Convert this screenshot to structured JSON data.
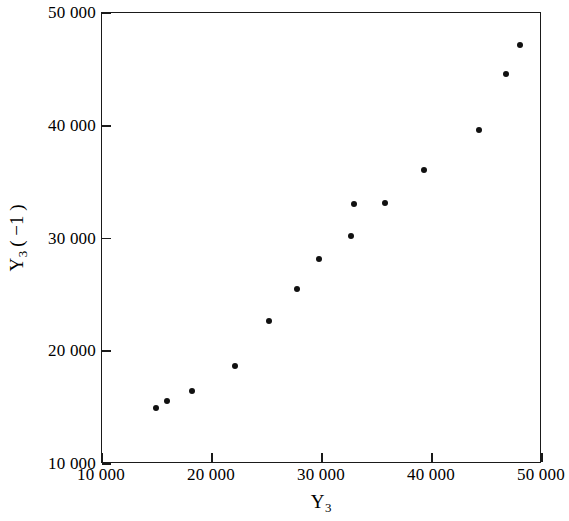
{
  "chart_data": {
    "type": "scatter",
    "title": "",
    "xlabel": "Y3",
    "ylabel": "Y3 (-1)",
    "xlabel_base": "Y",
    "xlabel_sub": "3",
    "ylabel_base": "Y",
    "ylabel_sub": "3",
    "ylabel_paren": "( −1 )",
    "xlim": [
      10000,
      50000
    ],
    "ylim": [
      10000,
      50000
    ],
    "xticks": [
      10000,
      20000,
      30000,
      40000,
      50000
    ],
    "yticks": [
      10000,
      20000,
      30000,
      40000,
      50000
    ],
    "xticklabels": [
      "10 000",
      "20 000",
      "30 000",
      "40 000",
      "50 000"
    ],
    "yticklabels": [
      "10 000",
      "20 000",
      "30 000",
      "40 000",
      "50 000"
    ],
    "grid": false,
    "legend": null,
    "marker": "filled-circle",
    "marker_color": "#111111",
    "frame_color": "#1a1a1a",
    "background": "#ffffff",
    "x": [
      14900,
      15900,
      18200,
      22100,
      25200,
      27700,
      29700,
      32600,
      32900,
      35700,
      39300,
      44300,
      46700,
      48000
    ],
    "y": [
      14970,
      15590,
      16480,
      18690,
      22680,
      25520,
      28180,
      30220,
      33060,
      33150,
      36070,
      39620,
      44590,
      47160
    ],
    "points": [
      {
        "x": 14900,
        "y": 14970
      },
      {
        "x": 15900,
        "y": 15590
      },
      {
        "x": 18200,
        "y": 16480
      },
      {
        "x": 22100,
        "y": 18690
      },
      {
        "x": 25200,
        "y": 22680
      },
      {
        "x": 27700,
        "y": 25520
      },
      {
        "x": 29700,
        "y": 28180
      },
      {
        "x": 32600,
        "y": 30220
      },
      {
        "x": 32900,
        "y": 33060
      },
      {
        "x": 35700,
        "y": 33150
      },
      {
        "x": 39300,
        "y": 36070
      },
      {
        "x": 44300,
        "y": 39620
      },
      {
        "x": 46700,
        "y": 44590
      },
      {
        "x": 48000,
        "y": 47160
      }
    ]
  }
}
